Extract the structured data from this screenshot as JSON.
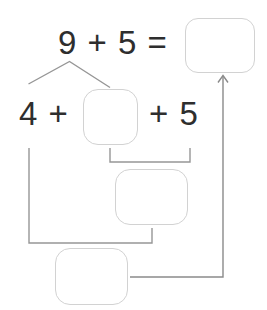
{
  "equation": {
    "text": "9 + 5 ="
  },
  "decomposition": {
    "left": "4 +",
    "right": "+ 5"
  },
  "boxes": {
    "sum": "",
    "part": "",
    "intermediate": "",
    "final": ""
  },
  "colors": {
    "background": "#ffffff",
    "text": "#2e2e2e",
    "line": "#969696",
    "arrow-line": "#8a8a8a",
    "box-border": "#d2d2d2"
  }
}
